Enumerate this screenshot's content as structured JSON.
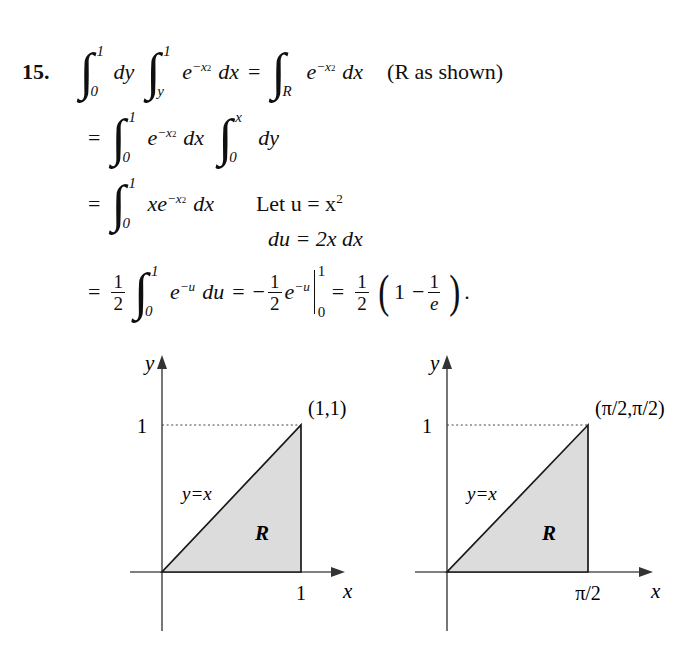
{
  "problem": {
    "number": "15.",
    "note": "(R as shown)"
  },
  "symbols": {
    "integral": "∫",
    "equals": "=",
    "minus": "−",
    "paren_open": "(",
    "paren_close": ")",
    "period": "."
  },
  "equations": {
    "line1": {
      "int1_lower": "0",
      "int1_upper": "1",
      "dy": "dy",
      "int2_lower": "y",
      "int2_upper": "1",
      "e": "e",
      "exp": "−x",
      "exp_pow": "2",
      "dx": "dx",
      "eq": "=",
      "int3_lower": "R",
      "e2": "e",
      "exp2": "−x",
      "exp2_pow": "2",
      "dx2": "dx",
      "note": "(R as shown)"
    },
    "line2": {
      "eq": "=",
      "int_lower": "0",
      "int_upper": "1",
      "e": "e",
      "exp": "−x",
      "exp_pow": "2",
      "dx": "dx",
      "int2_lower": "0",
      "int2_upper": "x",
      "dy": "dy"
    },
    "line3": {
      "eq": "=",
      "int_lower": "0",
      "int_upper": "1",
      "x": "x",
      "e": "e",
      "exp": "−x",
      "exp_pow": "2",
      "dx": "dx",
      "substitution": "Let u = x",
      "sub_pow": "2"
    },
    "line4": {
      "du": "du = 2x dx"
    },
    "line5": {
      "eq1": "=",
      "frac1_num": "1",
      "frac1_den": "2",
      "int_lower": "0",
      "int_upper": "1",
      "e": "e",
      "exp": "−u",
      "du": "du",
      "eq2": "=",
      "minus": "−",
      "frac2_num": "1",
      "frac2_den": "2",
      "e2": "e",
      "exp2": "−u",
      "eval_lower": "0",
      "eval_upper": "1",
      "eq3": "=",
      "frac3_num": "1",
      "frac3_den": "2",
      "paren_open": "(",
      "one": "1",
      "minus2": "−",
      "frac4_num": "1",
      "frac4_den": "e",
      "paren_close": ")",
      "period": "."
    }
  },
  "figures": [
    {
      "id": "left",
      "y_axis_label": "y",
      "x_axis_label": "x",
      "y_tick_label": "1",
      "x_tick_label": "1",
      "apex_label": "(1,1)",
      "line_label": "y=x",
      "region_label": "R",
      "fill_color": "#dcdcdc",
      "stroke_color": "#1a1a1a"
    },
    {
      "id": "right",
      "y_axis_label": "y",
      "x_axis_label": "x",
      "y_tick_label": "1",
      "x_tick_label": "π/2",
      "apex_label": "(π/2,π/2)",
      "line_label": "y=x",
      "region_label": "R",
      "fill_color": "#dcdcdc",
      "stroke_color": "#1a1a1a"
    }
  ]
}
